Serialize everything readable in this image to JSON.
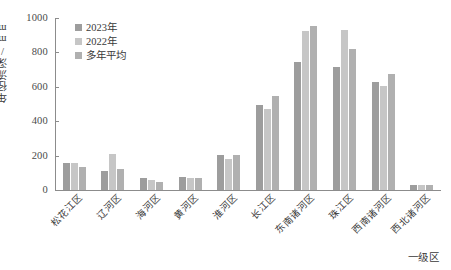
{
  "chart_data": {
    "type": "bar",
    "title": "",
    "xlabel": "一级区",
    "ylabel": "年径流深/mm",
    "ylim": [
      0,
      1000
    ],
    "ytick_labels": [
      "0",
      "200",
      "400",
      "600",
      "800",
      "1000"
    ],
    "ytick_values": [
      0,
      200,
      400,
      600,
      800,
      1000
    ],
    "grid": false,
    "legend_position": "upper-left-inside",
    "categories": [
      "松花江区",
      "辽河区",
      "海河区",
      "黄河区",
      "淮河区",
      "长江区",
      "东南诸河区",
      "珠江区",
      "西南诸河区",
      "西北诸河区"
    ],
    "series": [
      {
        "name": "2023年",
        "color": "#9d9d9d",
        "values": [
          158,
          110,
          72,
          78,
          205,
          492,
          745,
          718,
          628,
          30
        ]
      },
      {
        "name": "2022年",
        "color": "#c6c6c6",
        "values": [
          158,
          212,
          57,
          68,
          182,
          472,
          922,
          930,
          607,
          28
        ]
      },
      {
        "name": "多年平均",
        "color": "#b0b0b0",
        "values": [
          133,
          123,
          48,
          68,
          205,
          545,
          953,
          817,
          675,
          28
        ]
      }
    ]
  }
}
